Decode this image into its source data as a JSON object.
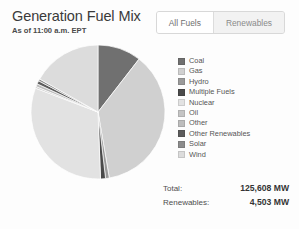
{
  "header": {
    "title": "Generation Fuel Mix",
    "subtitle": "As of 11:00 a.m. EPT"
  },
  "toggle": {
    "options": [
      {
        "label": "All Fuels",
        "active": true
      },
      {
        "label": "Renewables",
        "active": false
      }
    ]
  },
  "totals": [
    {
      "label": "Total:",
      "value": "125,608 MW"
    },
    {
      "label": "Renewables:",
      "value": "4,503 MW"
    }
  ],
  "chart_data": {
    "type": "pie",
    "title": "Generation Fuel Mix",
    "subtitle": "As of 11:00 a.m. EPT",
    "unit": "MW",
    "legend_position": "right",
    "grid": false,
    "total_mw": 125608,
    "renewables_mw": 4503,
    "categories": [
      "Coal",
      "Gas",
      "Hydro",
      "Multiple Fuels",
      "Nuclear",
      "Oil",
      "Other",
      "Other Renewables",
      "Solar",
      "Wind"
    ],
    "colors": [
      "#707070",
      "#d0d0d0",
      "#9a9a9a",
      "#4a4a4a",
      "#e2e2e2",
      "#c4c4c4",
      "#bdbdbd",
      "#5c5c5c",
      "#8c8c8c",
      "#dcdcdc"
    ],
    "values": [
      10.5,
      36.8,
      0.9,
      1.2,
      31.4,
      0.4,
      0.7,
      0.8,
      0.5,
      16.8
    ],
    "slices": [
      {
        "label": "Coal",
        "percent": 10.5,
        "color": "#707070"
      },
      {
        "label": "Gas",
        "percent": 36.8,
        "color": "#d0d0d0"
      },
      {
        "label": "Hydro",
        "percent": 0.9,
        "color": "#9a9a9a"
      },
      {
        "label": "Multiple Fuels",
        "percent": 1.2,
        "color": "#4a4a4a"
      },
      {
        "label": "Nuclear",
        "percent": 31.4,
        "color": "#e2e2e2"
      },
      {
        "label": "Oil",
        "percent": 0.4,
        "color": "#c4c4c4"
      },
      {
        "label": "Other",
        "percent": 0.7,
        "color": "#bdbdbd"
      },
      {
        "label": "Other Renewables",
        "percent": 0.8,
        "color": "#5c5c5c"
      },
      {
        "label": "Solar",
        "percent": 0.5,
        "color": "#8c8c8c"
      },
      {
        "label": "Wind",
        "percent": 16.8,
        "color": "#dcdcdc"
      }
    ],
    "geometry": {
      "cx": 70,
      "cy": 70,
      "r": 67,
      "start_angle_deg": -90
    }
  }
}
